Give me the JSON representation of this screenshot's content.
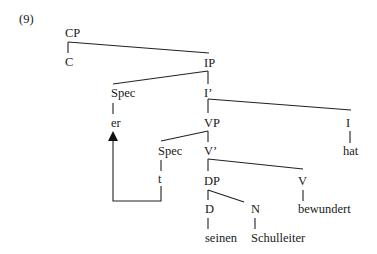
{
  "example_number": "(9)",
  "nodes": {
    "cp": "CP",
    "c": "C",
    "ip": "IP",
    "spec_ip": "Spec",
    "er": "er",
    "i_bar": "I’",
    "vp": "VP",
    "i": "I",
    "hat": "hat",
    "spec_vp": "Spec",
    "t": "t",
    "v_bar": "V’",
    "dp": "DP",
    "v": "V",
    "bewundert": "bewundert",
    "d": "D",
    "n": "N",
    "seinen": "seinen",
    "schulleiter": "Schulleiter"
  },
  "movement_arrow": {
    "from": "t",
    "to": "er"
  }
}
